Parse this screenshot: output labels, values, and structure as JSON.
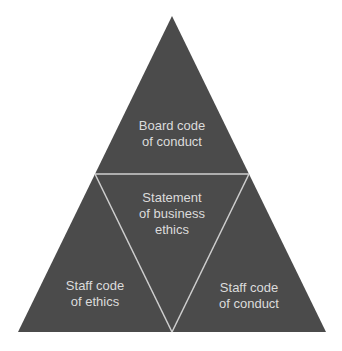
{
  "diagram": {
    "type": "pyramid-four-triangle",
    "colors": {
      "fill": "#4b4b4b",
      "divider": "#cfcfcf",
      "text": "#dcdcdc",
      "background": "#ffffff"
    },
    "segments": {
      "top": {
        "lines": [
          "Board code",
          "of conduct"
        ]
      },
      "center": {
        "lines": [
          "Statement",
          "of business",
          "ethics"
        ]
      },
      "bottom_left": {
        "lines": [
          "Staff code",
          "of ethics"
        ]
      },
      "bottom_right": {
        "lines": [
          "Staff code",
          "of conduct"
        ]
      }
    }
  }
}
